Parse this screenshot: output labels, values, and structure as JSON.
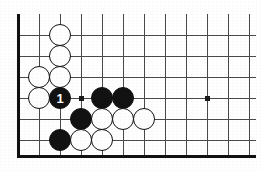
{
  "figure": {
    "kind": "go-board-diagram",
    "width": 261,
    "height": 171,
    "background_color": "#ffffff"
  },
  "board": {
    "line_color": "#4a4a4a",
    "edge_color": "#111111",
    "line_width": 1,
    "edge_line_width": 3,
    "cell_size": 21,
    "origin_x": 18,
    "origin_y": 14,
    "vertical_lines_x": [
      18,
      39,
      60,
      81,
      102,
      123,
      144,
      165,
      186,
      207,
      228,
      249
    ],
    "horizontal_lines_y": [
      35,
      56,
      77,
      98,
      119,
      140
    ],
    "left_edge_x": 18,
    "bottom_edge_y": 156,
    "top_clip_y": 14,
    "right_clip_x": 256,
    "star_points": [
      {
        "name": "star-point-left",
        "x": 81,
        "y": 98
      },
      {
        "name": "star-point-right",
        "x": 207,
        "y": 98
      }
    ],
    "star_point_size": 5,
    "star_point_color": "#1a1a1a"
  },
  "stones": {
    "radius": 11,
    "white_fill": "#ffffff",
    "white_outline": "#111111",
    "black_fill": "#121212",
    "label_color": "#ffffff",
    "items": [
      {
        "name": "white-stone-1",
        "color": "white",
        "x": 60,
        "y": 35,
        "label": ""
      },
      {
        "name": "white-stone-2",
        "color": "white",
        "x": 60,
        "y": 56,
        "label": ""
      },
      {
        "name": "white-stone-3",
        "color": "white",
        "x": 39,
        "y": 77,
        "label": ""
      },
      {
        "name": "white-stone-4",
        "color": "white",
        "x": 60,
        "y": 77,
        "label": ""
      },
      {
        "name": "white-stone-5",
        "color": "white",
        "x": 39,
        "y": 98,
        "label": ""
      },
      {
        "name": "black-move-1",
        "color": "black",
        "x": 60,
        "y": 98,
        "label": "1"
      },
      {
        "name": "black-stone-2",
        "color": "black",
        "x": 102,
        "y": 98,
        "label": ""
      },
      {
        "name": "black-stone-3",
        "color": "black",
        "x": 123,
        "y": 98,
        "label": ""
      },
      {
        "name": "black-stone-4",
        "color": "black",
        "x": 81,
        "y": 119,
        "label": ""
      },
      {
        "name": "white-stone-6",
        "color": "white",
        "x": 102,
        "y": 119,
        "label": ""
      },
      {
        "name": "white-stone-7",
        "color": "white",
        "x": 123,
        "y": 119,
        "label": ""
      },
      {
        "name": "white-stone-8",
        "color": "white",
        "x": 144,
        "y": 119,
        "label": ""
      },
      {
        "name": "black-stone-5",
        "color": "black",
        "x": 60,
        "y": 140,
        "label": ""
      },
      {
        "name": "white-stone-9",
        "color": "white",
        "x": 81,
        "y": 140,
        "label": ""
      },
      {
        "name": "white-stone-10",
        "color": "white",
        "x": 102,
        "y": 140,
        "label": ""
      }
    ]
  },
  "move_markers": [
    {
      "name": "move-number-1",
      "number": "1",
      "stone": "black-move-1"
    }
  ]
}
